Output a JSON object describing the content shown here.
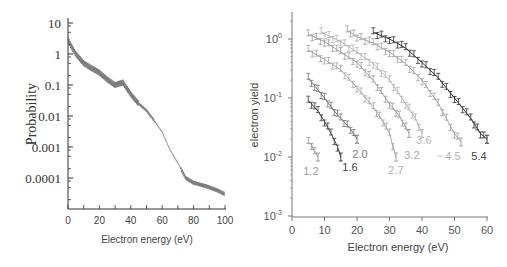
{
  "chart_data": [
    {
      "type": "line",
      "title": "",
      "xlabel": "Electron energy (eV)",
      "ylabel": "Probability",
      "xlim": [
        0,
        100
      ],
      "ylim": [
        1e-05,
        10
      ],
      "yscale": "log",
      "grid": false,
      "x_ticks": [
        "0",
        "20",
        "40",
        "60",
        "80",
        "100"
      ],
      "y_ticks": [
        "10",
        "1",
        "0.1",
        "0.01",
        "0.001",
        "0.0001"
      ],
      "series": [
        {
          "name": "Probability",
          "color": "#555555",
          "x": [
            0,
            2,
            5,
            10,
            15,
            20,
            25,
            30,
            35,
            40,
            45,
            50,
            55,
            60,
            65,
            70,
            75,
            80,
            85,
            90,
            95,
            100
          ],
          "values": [
            3,
            1.8,
            1.0,
            0.5,
            0.35,
            0.25,
            0.15,
            0.1,
            0.12,
            0.05,
            0.025,
            0.015,
            0.007,
            0.003,
            0.0008,
            0.0003,
            0.0001,
            7e-05,
            6e-05,
            5e-05,
            4e-05,
            3e-05
          ]
        }
      ]
    },
    {
      "type": "line",
      "title": "",
      "xlabel": "Electron energy (eV)",
      "ylabel": "electron yield",
      "xlim": [
        0,
        60
      ],
      "ylim": [
        0.001,
        3
      ],
      "yscale": "log",
      "grid": false,
      "x_ticks": [
        "0",
        "10",
        "20",
        "30",
        "40",
        "50",
        "60"
      ],
      "y_ticks": [
        "10^0",
        "10^-1",
        "10^-2",
        "10^-3"
      ],
      "annotations": [
        "1.2",
        "1.6",
        "2.0",
        "2.7",
        "3.2",
        "3.6",
        "4.5",
        "5.4"
      ],
      "series": [
        {
          "name": "1.2",
          "color": "#9a9a9a",
          "x": [
            5,
            6,
            7,
            8
          ],
          "values": [
            0.018,
            0.016,
            0.012,
            0.01
          ]
        },
        {
          "name": "1.6",
          "color": "#444444",
          "x": [
            5,
            6,
            8,
            10,
            12,
            14,
            15
          ],
          "values": [
            0.09,
            0.08,
            0.06,
            0.04,
            0.025,
            0.015,
            0.01
          ]
        },
        {
          "name": "2.0",
          "color": "#777777",
          "x": [
            5,
            7,
            10,
            13,
            15,
            18,
            20
          ],
          "values": [
            0.22,
            0.16,
            0.1,
            0.06,
            0.045,
            0.03,
            0.02
          ]
        },
        {
          "name": "2.7",
          "color": "#a8a8a8",
          "x": [
            5,
            10,
            15,
            20,
            25,
            28,
            30,
            32
          ],
          "values": [
            0.65,
            0.45,
            0.3,
            0.15,
            0.07,
            0.04,
            0.025,
            0.01
          ]
        },
        {
          "name": "3.2",
          "color": "#a0a0a0",
          "x": [
            5,
            10,
            15,
            20,
            25,
            30,
            33,
            36
          ],
          "values": [
            1.2,
            0.9,
            0.6,
            0.4,
            0.2,
            0.08,
            0.05,
            0.025
          ]
        },
        {
          "name": "3.6",
          "color": "#b5b5b5",
          "x": [
            9,
            15,
            20,
            25,
            30,
            35,
            38,
            40
          ],
          "values": [
            1.3,
            0.9,
            0.6,
            0.38,
            0.2,
            0.08,
            0.045,
            0.025
          ]
        },
        {
          "name": "4.5",
          "color": "#a5a5a5",
          "x": [
            17,
            20,
            25,
            30,
            35,
            40,
            45,
            50,
            52
          ],
          "values": [
            1.4,
            1.1,
            0.85,
            0.6,
            0.38,
            0.2,
            0.08,
            0.025,
            0.018
          ]
        },
        {
          "name": "5.4",
          "color": "#333333",
          "x": [
            25,
            30,
            35,
            40,
            45,
            50,
            55,
            58,
            60
          ],
          "values": [
            1.3,
            1.0,
            0.7,
            0.4,
            0.22,
            0.1,
            0.045,
            0.025,
            0.02
          ]
        }
      ]
    }
  ],
  "left_chart": {
    "ylabel": "Probability",
    "xlabel": "Electron energy (eV)",
    "x_ticks": [
      "0",
      "20",
      "40",
      "60",
      "80",
      "100"
    ],
    "y_ticks": [
      "10",
      "1",
      "0.1",
      "0.01",
      "0.001",
      "0.0001"
    ]
  },
  "right_chart": {
    "ylabel": "electron yield",
    "xlabel": "Electron energy (eV)",
    "x_ticks": [
      "0",
      "10",
      "20",
      "30",
      "40",
      "50",
      "60"
    ],
    "y_tick_base": "10",
    "y_tick_exps": [
      "0",
      "-1",
      "-2",
      "-3"
    ],
    "labels": [
      "1.2",
      "1.6",
      "2.0",
      "2.7",
      "3.2",
      "3.6",
      "4.5",
      "5.4"
    ]
  }
}
